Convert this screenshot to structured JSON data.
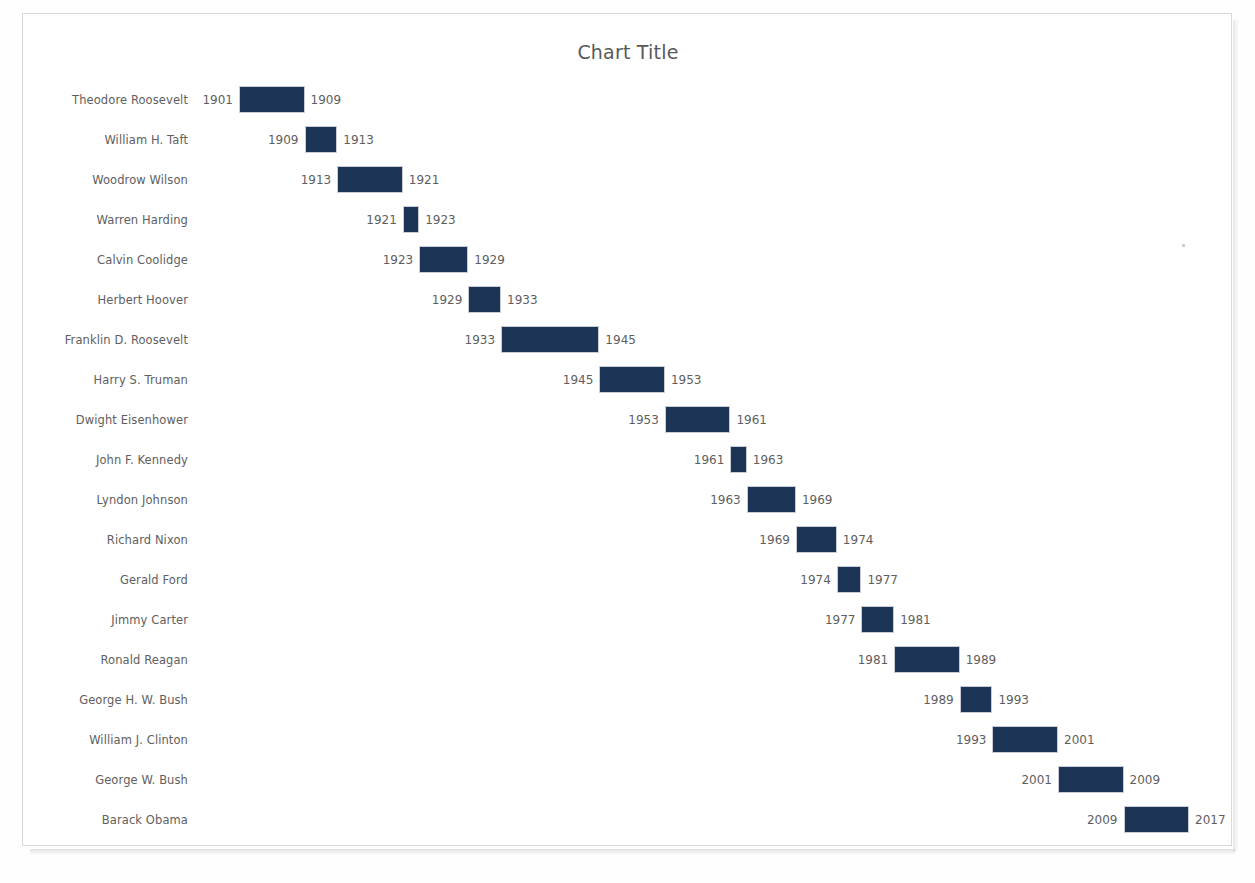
{
  "chart": {
    "title": "Chart Title",
    "background_color": "#ffffff",
    "border_color": "#d9d9d9",
    "bar_color": "#1c3557",
    "label_color": "#606060",
    "title_color": "#595959"
  },
  "chart_data": {
    "type": "bar",
    "subtype": "gantt-range-bar",
    "title": "Chart Title",
    "xlabel": "",
    "ylabel": "",
    "orientation": "horizontal",
    "grid": false,
    "legend": null,
    "xlim": [
      1901,
      2017
    ],
    "axis_visible": false,
    "tick_labels_visible": false,
    "data_labels": "start and end year shown at each bar end",
    "categories": [
      "Theodore Roosevelt",
      "William H. Taft",
      "Woodrow Wilson",
      "Warren Harding",
      "Calvin Coolidge",
      "Herbert Hoover",
      "Franklin D. Roosevelt",
      "Harry S. Truman",
      "Dwight Eisenhower",
      "John F. Kennedy",
      "Lyndon Johnson",
      "Richard Nixon",
      "Gerald Ford",
      "Jimmy Carter",
      "Ronald Reagan",
      "George H. W. Bush",
      "William J. Clinton",
      "George W. Bush",
      "Barack Obama"
    ],
    "series": [
      {
        "name": "Term",
        "start": [
          1901,
          1909,
          1913,
          1921,
          1923,
          1929,
          1933,
          1945,
          1953,
          1961,
          1963,
          1969,
          1974,
          1977,
          1981,
          1989,
          1993,
          2001,
          2009
        ],
        "end": [
          1909,
          1913,
          1921,
          1923,
          1929,
          1933,
          1945,
          1953,
          1961,
          1963,
          1969,
          1974,
          1977,
          1981,
          1989,
          1993,
          2001,
          2009,
          2017
        ],
        "duration": [
          8,
          4,
          8,
          2,
          6,
          4,
          12,
          8,
          8,
          2,
          6,
          5,
          3,
          4,
          8,
          4,
          8,
          8,
          8
        ]
      }
    ],
    "rows": [
      {
        "label": "Theodore Roosevelt",
        "start": 1901,
        "end": 1909,
        "start_label": "1901",
        "end_label": "1909"
      },
      {
        "label": "William H. Taft",
        "start": 1909,
        "end": 1913,
        "start_label": "1909",
        "end_label": "1913"
      },
      {
        "label": "Woodrow Wilson",
        "start": 1913,
        "end": 1921,
        "start_label": "1913",
        "end_label": "1921"
      },
      {
        "label": "Warren Harding",
        "start": 1921,
        "end": 1923,
        "start_label": "1921",
        "end_label": "1923"
      },
      {
        "label": "Calvin Coolidge",
        "start": 1923,
        "end": 1929,
        "start_label": "1923",
        "end_label": "1929"
      },
      {
        "label": "Herbert Hoover",
        "start": 1929,
        "end": 1933,
        "start_label": "1929",
        "end_label": "1933"
      },
      {
        "label": "Franklin D. Roosevelt",
        "start": 1933,
        "end": 1945,
        "start_label": "1933",
        "end_label": "1945"
      },
      {
        "label": "Harry S. Truman",
        "start": 1945,
        "end": 1953,
        "start_label": "1945",
        "end_label": "1953"
      },
      {
        "label": "Dwight Eisenhower",
        "start": 1953,
        "end": 1961,
        "start_label": "1953",
        "end_label": "1961"
      },
      {
        "label": "John F. Kennedy",
        "start": 1961,
        "end": 1963,
        "start_label": "1961",
        "end_label": "1963"
      },
      {
        "label": "Lyndon Johnson",
        "start": 1963,
        "end": 1969,
        "start_label": "1963",
        "end_label": "1969"
      },
      {
        "label": "Richard Nixon",
        "start": 1969,
        "end": 1974,
        "start_label": "1969",
        "end_label": "1974"
      },
      {
        "label": "Gerald Ford",
        "start": 1974,
        "end": 1977,
        "start_label": "1974",
        "end_label": "1977"
      },
      {
        "label": "Jimmy Carter",
        "start": 1977,
        "end": 1981,
        "start_label": "1977",
        "end_label": "1981"
      },
      {
        "label": "Ronald Reagan",
        "start": 1981,
        "end": 1989,
        "start_label": "1981",
        "end_label": "1989"
      },
      {
        "label": "George H. W. Bush",
        "start": 1989,
        "end": 1993,
        "start_label": "1989",
        "end_label": "1993"
      },
      {
        "label": "William J. Clinton",
        "start": 1993,
        "end": 2001,
        "start_label": "1993",
        "end_label": "2001"
      },
      {
        "label": "George W. Bush",
        "start": 2001,
        "end": 2009,
        "start_label": "2001",
        "end_label": "2009"
      },
      {
        "label": "Barack Obama",
        "start": 2009,
        "end": 2017,
        "start_label": "2009",
        "end_label": "2017"
      }
    ]
  },
  "layout": {
    "row_height": 40,
    "first_row_top": 66,
    "bar_origin_x": 216,
    "px_per_year": 8.19
  }
}
